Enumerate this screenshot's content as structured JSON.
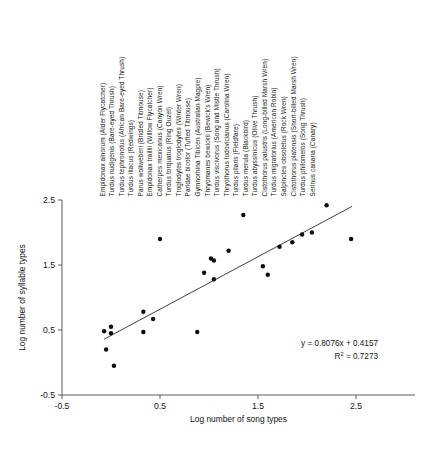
{
  "chart_data": {
    "type": "scatter",
    "title": "",
    "xlabel": "Log number of song types",
    "ylabel": "Log number of syllable types",
    "xlim": [
      -0.5,
      2.5
    ],
    "ylim": [
      -0.5,
      2.5
    ],
    "xticks": [
      "-0.5",
      "0.5",
      "1.5",
      "2.5"
    ],
    "yticks": [
      "-0.5",
      "0.5",
      "1.5",
      "2.5"
    ],
    "grid": false,
    "legend": "none",
    "annotations": {
      "equation": "y = 0.8076x + 0.4157",
      "r_squared_label": "R",
      "r_squared_sup": "2",
      "r_squared_value": " = 0.7273"
    },
    "trendline": {
      "slope": 0.8076,
      "intercept": 0.4157,
      "r_squared": 0.7273,
      "x_start": -0.07,
      "x_end": 2.46
    },
    "x": [
      -0.07,
      -0.05,
      0.0,
      0.0,
      0.03,
      0.33,
      0.33,
      0.43,
      0.5,
      0.88,
      0.95,
      1.02,
      1.05,
      1.05,
      1.2,
      1.35,
      1.55,
      1.6,
      1.72,
      1.85,
      1.95,
      2.05,
      2.2,
      2.45
    ],
    "y": [
      0.48,
      0.2,
      0.55,
      0.45,
      -0.05,
      0.78,
      0.47,
      0.67,
      1.9,
      0.47,
      1.38,
      1.6,
      1.57,
      1.28,
      1.72,
      2.27,
      1.48,
      1.35,
      1.78,
      1.85,
      1.97,
      2.0,
      2.42,
      1.9
    ],
    "points": [
      {
        "x": -0.07,
        "y": 0.48
      },
      {
        "x": -0.05,
        "y": 0.2
      },
      {
        "x": 0.0,
        "y": 0.55
      },
      {
        "x": 0.0,
        "y": 0.45
      },
      {
        "x": 0.03,
        "y": -0.05
      },
      {
        "x": 0.33,
        "y": 0.78
      },
      {
        "x": 0.33,
        "y": 0.47
      },
      {
        "x": 0.43,
        "y": 0.67
      },
      {
        "x": 0.5,
        "y": 1.9
      },
      {
        "x": 0.88,
        "y": 0.47
      },
      {
        "x": 0.95,
        "y": 1.38
      },
      {
        "x": 1.02,
        "y": 1.6
      },
      {
        "x": 1.05,
        "y": 1.57
      },
      {
        "x": 1.05,
        "y": 1.28
      },
      {
        "x": 1.2,
        "y": 1.72
      },
      {
        "x": 1.35,
        "y": 2.27
      },
      {
        "x": 1.55,
        "y": 1.48
      },
      {
        "x": 1.6,
        "y": 1.35
      },
      {
        "x": 1.72,
        "y": 1.78
      },
      {
        "x": 1.85,
        "y": 1.85
      },
      {
        "x": 1.95,
        "y": 1.97
      },
      {
        "x": 2.05,
        "y": 2.0
      },
      {
        "x": 2.2,
        "y": 2.42
      },
      {
        "x": 2.45,
        "y": 1.9
      }
    ],
    "species": [
      "Empidonax alnorum (Alder Flycatcher)",
      "Turdus nudigenis (Bare-eyed Thrush)",
      "Turdus tephronotus (African Bare-eyed Thrush)",
      "Turdus iliacus (Redwings)",
      "Parus wollweberi (Bridled Titmouse)",
      "Empidonax traillii (Willow Flycatcher)",
      "Catherpes mexicanus (Canyon Wren)",
      "Turdus torquatus (Ring Ouzel)",
      "Troglodytes troglodytes (Winter Wren)",
      "Paridae bicolor (Tufted Titmouse)",
      "Gymnorhina Tibicen (Australian Magpie)",
      "Thryomanes bewickii (Bewick's Wren)",
      "Turdus viscivorus (Song and Mistle Thrush)",
      "Thryothorus ludovicianus (Carolina Wren)",
      "Turdus pilaris (Fieldfare)",
      "Turdus merula (Blackbird)",
      "Turdus abyssinicus (Olive Thrush)",
      "Cistothorus palustris (Long-billed Marsh Wren)",
      "Turdus migratorius (American Robin)",
      "Salpinctes obsoletus (Rock Wren)",
      "Cistothorus platensis (Short-billed Marsh Wren)",
      "Turdus philomelos (Song Thrush)",
      "Serinus canaria (Canary)"
    ]
  }
}
